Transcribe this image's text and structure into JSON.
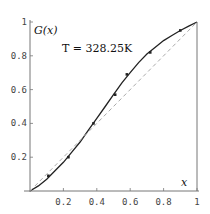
{
  "chart_data": {
    "type": "line",
    "title": "",
    "xlabel": "x",
    "ylabel": "G(x)",
    "annotation": "T = 328.25K",
    "xlim": [
      0,
      1
    ],
    "ylim": [
      0,
      1
    ],
    "x_ticks": [
      "0.2",
      "0.4",
      "0.6",
      "0.8",
      "1"
    ],
    "y_ticks": [
      "0.2",
      "0.4",
      "0.6",
      "0.8",
      "1"
    ],
    "grid": false,
    "series": [
      {
        "name": "fitted curve",
        "style": "solid",
        "color": "#222222",
        "x": [
          0,
          0.05,
          0.1,
          0.15,
          0.2,
          0.25,
          0.3,
          0.35,
          0.4,
          0.45,
          0.5,
          0.55,
          0.6,
          0.65,
          0.7,
          0.75,
          0.8,
          0.85,
          0.9,
          0.95,
          1
        ],
        "y": [
          0,
          0.03,
          0.07,
          0.12,
          0.17,
          0.23,
          0.29,
          0.36,
          0.43,
          0.5,
          0.57,
          0.64,
          0.7,
          0.76,
          0.81,
          0.85,
          0.89,
          0.92,
          0.95,
          0.975,
          1
        ]
      },
      {
        "name": "diagonal reference",
        "style": "dashed",
        "color": "#aaaaaa",
        "x": [
          0,
          1
        ],
        "y": [
          0,
          1
        ]
      },
      {
        "name": "data points",
        "style": "markers",
        "color": "#222222",
        "x": [
          0.11,
          0.23,
          0.38,
          0.51,
          0.58,
          0.72,
          0.9
        ],
        "y": [
          0.09,
          0.2,
          0.4,
          0.57,
          0.69,
          0.82,
          0.95
        ]
      }
    ]
  }
}
